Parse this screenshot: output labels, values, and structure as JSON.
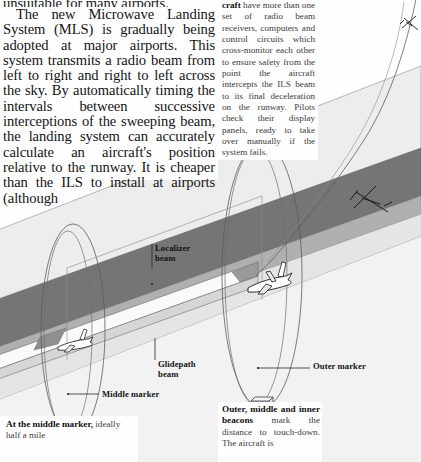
{
  "page": {
    "type": "printed-book-page",
    "topic": "Instrument Landing System / Microwave Landing System"
  },
  "columns": {
    "left": {
      "cut_line": "unsuitable for many airports.",
      "body": "The new Microwave Landing System (MLS) is gradually being adopted at major airports. This system transmits a radio beam from left to right and right to left across the sky. By automatically timing the intervals between successive interceptions of the sweeping beam, the landing system can accurately calculate an aircraft's position relative to the runway. It is cheaper than the ILS to install at airports (although"
    },
    "right": {
      "lead": "craft",
      "body": " have more than one set of radio beam receivers, computers and control circuits which cross-monitor each other to ensure safety from the point the aircraft intercepts the ILS beam to its final deceleration on the runway. Pilots check their display panels, ready to take over manually if the system fails."
    }
  },
  "captions": {
    "left": {
      "lead": "At the middle marker,",
      "body": "ideally half a mile"
    },
    "right": {
      "lead": "Outer, middle and inner beacons",
      "body": " mark the distance to touch-down. The aircraft is"
    }
  },
  "diagram": {
    "name": "ils-approach-perspective-diagram",
    "labels": {
      "localizer": "Localizer\nbeam",
      "localizer_line1": "Localizer",
      "localizer_line2": "beam",
      "glidepath_line1": "Glidepath",
      "glidepath_line2": "beam",
      "middle_marker": "Middle marker",
      "outer_marker": "Outer marker"
    },
    "colors": {
      "localizer_plane": "#ebebeb",
      "glidepath_beam": "#7b7b7b",
      "glidepath_beam_light": "#b4b4b4",
      "runway_top": "#f4f4f4",
      "runway_side": "#d2d2d2",
      "ground": "#eeeeee",
      "outline": "#4a4a4a",
      "aircraft": "#1a1a1a",
      "marker_box": "#ffffff"
    },
    "elements": [
      "localizer-beam-plane",
      "glidepath-beam-wedge",
      "runway-strip",
      "middle-marker-cone",
      "outer-marker-cone",
      "middle-marker-beacon-box",
      "outer-marker-beacon-box",
      "approach-path-curve",
      "aircraft-high",
      "aircraft-descending",
      "aircraft-on-glidepath",
      "aircraft-touchdown"
    ]
  }
}
